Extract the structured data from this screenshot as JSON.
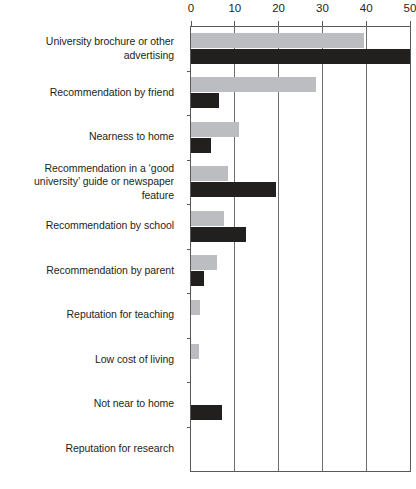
{
  "chart_data": {
    "type": "bar",
    "orientation": "horizontal",
    "title": "",
    "xlabel": "",
    "ylabel": "",
    "xlim": [
      0,
      50
    ],
    "xticks": [
      0,
      10,
      20,
      30,
      40,
      50
    ],
    "grid": true,
    "legend": "none",
    "categories": [
      "University brochure or other advertising",
      "Recommendation by friend",
      "Nearness to home",
      "Recommendation in a ‘good university’ guide or newspaper feature",
      "Recommendation by school",
      "Recommendation by parent",
      "Reputation for teaching",
      "Low cost of living",
      "Not near to home",
      "Reputation for research"
    ],
    "series": [
      {
        "name": "Series 1",
        "color": "#bcbdc0",
        "values": [
          39.5,
          28.5,
          11,
          8.5,
          7.5,
          6,
          2,
          1.8,
          0,
          0
        ]
      },
      {
        "name": "Series 2",
        "color": "#221f1f",
        "values": [
          50,
          6.5,
          4.5,
          19.5,
          12.5,
          3,
          0,
          0,
          7,
          0
        ]
      }
    ]
  },
  "axis": {
    "tick_labels": [
      "0",
      "10",
      "20",
      "30",
      "40",
      "50"
    ]
  }
}
